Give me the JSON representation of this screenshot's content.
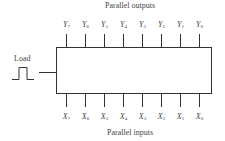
{
  "diagram": {
    "title_top": "Parallel outputs",
    "title_bottom": "Parallel inputs",
    "load_label": "Load",
    "outputs": [
      {
        "letter": "Y",
        "sub": "7"
      },
      {
        "letter": "Y",
        "sub": "6"
      },
      {
        "letter": "Y",
        "sub": "5"
      },
      {
        "letter": "Y",
        "sub": "4"
      },
      {
        "letter": "Y",
        "sub": "3"
      },
      {
        "letter": "Y",
        "sub": "2"
      },
      {
        "letter": "Y",
        "sub": "1"
      },
      {
        "letter": "Y",
        "sub": "0"
      }
    ],
    "inputs": [
      {
        "letter": "X",
        "sub": "7"
      },
      {
        "letter": "X",
        "sub": "6"
      },
      {
        "letter": "X",
        "sub": "5"
      },
      {
        "letter": "X",
        "sub": "4"
      },
      {
        "letter": "X",
        "sub": "3"
      },
      {
        "letter": "X",
        "sub": "2"
      },
      {
        "letter": "X",
        "sub": "1"
      },
      {
        "letter": "X",
        "sub": "0"
      }
    ],
    "line_color": "#333333"
  }
}
